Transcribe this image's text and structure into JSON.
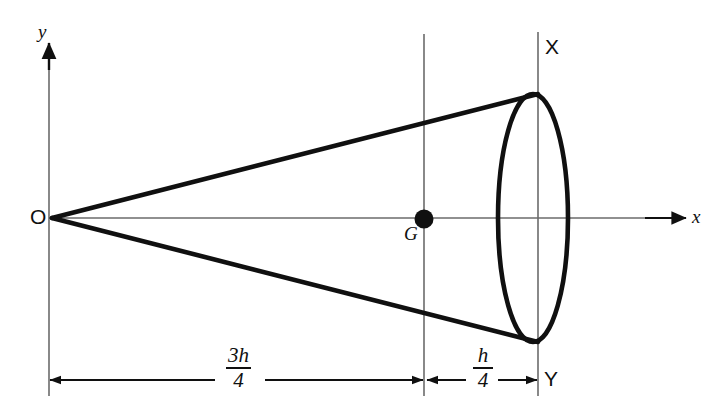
{
  "figure": {
    "background_color": "#ffffff",
    "ink_color": "#101010",
    "axis_color": "#6b6b6b",
    "width": 724,
    "height": 419
  },
  "axes": {
    "origin_label": "O",
    "x_axis_label": "x",
    "y_axis_label": "y",
    "origin_px": {
      "x": 49,
      "y": 218
    },
    "x_axis_end_px": {
      "x": 686,
      "y": 218
    },
    "y_axis_top_px": {
      "x": 49,
      "y": 43
    }
  },
  "points": [
    {
      "name": "apex",
      "label": "O",
      "x_px": 52,
      "y_px": 218
    },
    {
      "name": "centroid",
      "label": "G",
      "x_px": 424,
      "y_px": 219
    },
    {
      "name": "base-top",
      "label": "X",
      "x_px": 538,
      "y_px": 94
    },
    {
      "name": "base-bottom",
      "label": "Y",
      "x_px": 538,
      "y_px": 342
    }
  ],
  "base_ellipse": {
    "center_px": {
      "x": 533,
      "y": 218
    },
    "semi_width_px": 35,
    "semi_height_px": 124
  },
  "guide_lines": [
    {
      "name": "centroid-vertical",
      "x_px": 424,
      "y_top_px": 34,
      "y_bottom_px": 396
    },
    {
      "name": "base-vertical",
      "x_px": 538,
      "y_top_px": 32,
      "y_bottom_px": 396
    },
    {
      "name": "origin-vertical",
      "x_px": 49,
      "y_top_px": 43,
      "y_bottom_px": 396
    }
  ],
  "dimensions": [
    {
      "name": "distance-apex-to-centroid",
      "numerator": "3h",
      "denominator": "4",
      "from_px": 49,
      "to_px": 424,
      "baseline_y_px": 380,
      "label_center_px": 240
    },
    {
      "name": "distance-centroid-to-base",
      "numerator": "h",
      "denominator": "4",
      "from_px": 424,
      "to_px": 538,
      "baseline_y_px": 380,
      "label_center_px": 482
    }
  ]
}
